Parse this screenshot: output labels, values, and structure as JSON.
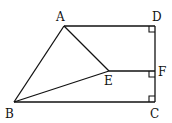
{
  "diagram": {
    "type": "geometry",
    "points": {
      "A": {
        "label": "A",
        "x": 64,
        "y": 26
      },
      "D": {
        "label": "D",
        "x": 155,
        "y": 26
      },
      "E": {
        "label": "E",
        "x": 109,
        "y": 71
      },
      "F": {
        "label": "F",
        "x": 155,
        "y": 71
      },
      "B": {
        "label": "B",
        "x": 14,
        "y": 102
      },
      "C": {
        "label": "C",
        "x": 155,
        "y": 102
      }
    },
    "segments": [
      "AD",
      "DC",
      "BC",
      "AB",
      "AE",
      "EF",
      "BE"
    ],
    "right_angles": [
      "D",
      "F",
      "C"
    ]
  }
}
